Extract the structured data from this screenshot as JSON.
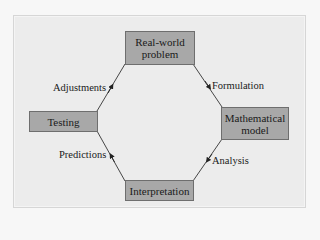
{
  "diagram": {
    "type": "cycle",
    "nodes": [
      {
        "id": "real_world",
        "label": "Real-world problem",
        "lines": [
          "Real-world",
          "problem"
        ]
      },
      {
        "id": "math_model",
        "label": "Mathematical model",
        "lines": [
          "Mathematical",
          "model"
        ]
      },
      {
        "id": "interpretation",
        "label": "Interpretation",
        "lines": [
          "Interpretation"
        ]
      },
      {
        "id": "testing",
        "label": "Testing",
        "lines": [
          "Testing"
        ]
      }
    ],
    "edges": [
      {
        "from": "real_world",
        "to": "math_model",
        "label": "Formulation"
      },
      {
        "from": "math_model",
        "to": "interpretation",
        "label": "Analysis"
      },
      {
        "from": "interpretation",
        "to": "testing",
        "label": "Predictions"
      },
      {
        "from": "testing",
        "to": "real_world",
        "label": "Adjustments"
      }
    ],
    "colors": {
      "panel_bg": "#ececec",
      "box_fill": "#a8a8a8",
      "box_border": "#6e6e6e",
      "line": "#333333"
    }
  }
}
